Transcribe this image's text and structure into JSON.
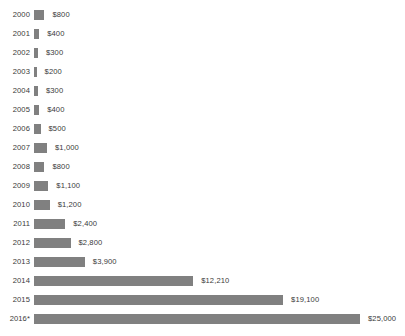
{
  "chart_data": {
    "type": "bar",
    "title": "",
    "subtitle": "",
    "xlabel": "",
    "ylabel": "",
    "orientation": "horizontal",
    "grid": false,
    "legend": false,
    "axis_visible": false,
    "xlim": [
      0,
      25000
    ],
    "bar_color": "#808080",
    "text_color": "#3a3a3a",
    "background_color": "#ffffff",
    "categories": [
      "2000",
      "2001",
      "2002",
      "2003",
      "2004",
      "2005",
      "2006",
      "2007",
      "2008",
      "2009",
      "2010",
      "2011",
      "2012",
      "2013",
      "2014",
      "2015",
      "2016*"
    ],
    "values": [
      800,
      400,
      300,
      200,
      300,
      400,
      500,
      1000,
      800,
      1100,
      1200,
      2400,
      2800,
      3900,
      12210,
      19100,
      25000
    ],
    "value_labels": [
      "$800",
      "$400",
      "$300",
      "$200",
      "$300",
      "$400",
      "$500",
      "$1,000",
      "$800",
      "$1,100",
      "$1,200",
      "$2,400",
      "$2,800",
      "$3,900",
      "$12,210",
      "$19,100",
      "$25,000"
    ],
    "footnote_marker": "*"
  },
  "title_remnant": ""
}
